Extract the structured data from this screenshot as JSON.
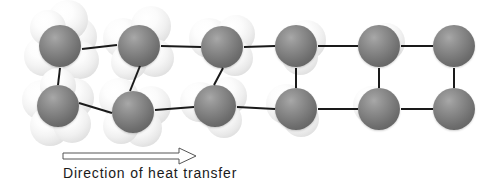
{
  "figure": {
    "width": 491,
    "height": 188,
    "background_color": "#ffffff",
    "molecule_color": "#6e6e6e",
    "ghost_color": "#e8e8e8",
    "bond_color": "#1a1a1a"
  },
  "caption": {
    "text": "Direction of heat transfer",
    "x": 63,
    "y": 165
  },
  "arrow": {
    "name": "heat-transfer-arrow",
    "direction": "right",
    "x1": 63,
    "y1": 156,
    "x2": 196,
    "y2": 156,
    "head_length": 17,
    "head_half_height": 8,
    "style": "hollow-outline",
    "stroke": "#555555"
  },
  "lattice": {
    "description": "Two rows of six molecules joined by bonds; vibration amplitude (number of pale ghost spheres) decreases from left (hot) to right (cold).",
    "rows": 2,
    "columns": 6,
    "radius": 21,
    "molecules": [
      {
        "id": "m-r1c1",
        "row": 1,
        "col": 1,
        "cx": 60,
        "cy": 46,
        "r": 21,
        "vibration": "high",
        "ghosts": [
          {
            "dx": -16,
            "dy": 10,
            "r": 20
          },
          {
            "dx": 17,
            "dy": -9,
            "r": 20
          },
          {
            "dx": 8,
            "dy": -26,
            "r": 20
          },
          {
            "dx": 20,
            "dy": 14,
            "r": 19
          },
          {
            "dx": -12,
            "dy": -18,
            "r": 18
          }
        ]
      },
      {
        "id": "m-r1c2",
        "row": 1,
        "col": 2,
        "cx": 139,
        "cy": 46,
        "r": 21,
        "vibration": "high",
        "ghosts": [
          {
            "dx": -16,
            "dy": -8,
            "r": 20
          },
          {
            "dx": 12,
            "dy": -20,
            "r": 20
          },
          {
            "dx": 16,
            "dy": 12,
            "r": 19
          },
          {
            "dx": -10,
            "dy": 16,
            "r": 18
          }
        ]
      },
      {
        "id": "m-r1c3",
        "row": 1,
        "col": 3,
        "cx": 222,
        "cy": 47,
        "r": 21,
        "vibration": "medium",
        "ghosts": [
          {
            "dx": -13,
            "dy": -9,
            "r": 20
          },
          {
            "dx": 14,
            "dy": -13,
            "r": 19
          },
          {
            "dx": 13,
            "dy": 11,
            "r": 18
          }
        ]
      },
      {
        "id": "m-r1c4",
        "row": 1,
        "col": 4,
        "cx": 296,
        "cy": 46,
        "r": 21,
        "vibration": "low",
        "ghosts": [
          {
            "dx": 10,
            "dy": -6,
            "r": 20
          },
          {
            "dx": 4,
            "dy": 11,
            "r": 18
          }
        ]
      },
      {
        "id": "m-r1c5",
        "row": 1,
        "col": 5,
        "cx": 379,
        "cy": 46,
        "r": 21,
        "vibration": "very-low",
        "ghosts": [
          {
            "dx": 7,
            "dy": -4,
            "r": 19
          }
        ]
      },
      {
        "id": "m-r1c6",
        "row": 1,
        "col": 6,
        "cx": 454,
        "cy": 46,
        "r": 21,
        "vibration": "none",
        "ghosts": []
      },
      {
        "id": "m-r2c1",
        "row": 2,
        "col": 1,
        "cx": 58,
        "cy": 106,
        "r": 21,
        "vibration": "high",
        "ghosts": [
          {
            "dx": -16,
            "dy": -6,
            "r": 20
          },
          {
            "dx": 16,
            "dy": -8,
            "r": 20
          },
          {
            "dx": -8,
            "dy": 20,
            "r": 20
          },
          {
            "dx": 14,
            "dy": 18,
            "r": 19
          },
          {
            "dx": 0,
            "dy": -20,
            "r": 18
          }
        ]
      },
      {
        "id": "m-r2c2",
        "row": 2,
        "col": 2,
        "cx": 133,
        "cy": 112,
        "r": 21,
        "vibration": "high",
        "ghosts": [
          {
            "dx": -14,
            "dy": -14,
            "r": 20
          },
          {
            "dx": 18,
            "dy": -6,
            "r": 20
          },
          {
            "dx": 10,
            "dy": 16,
            "r": 19
          },
          {
            "dx": -12,
            "dy": 14,
            "r": 18
          }
        ]
      },
      {
        "id": "m-r2c3",
        "row": 2,
        "col": 3,
        "cx": 215,
        "cy": 106,
        "r": 21,
        "vibration": "medium",
        "ghosts": [
          {
            "dx": -15,
            "dy": -4,
            "r": 20
          },
          {
            "dx": 13,
            "dy": -10,
            "r": 19
          },
          {
            "dx": 9,
            "dy": 14,
            "r": 18
          }
        ]
      },
      {
        "id": "m-r2c4",
        "row": 2,
        "col": 4,
        "cx": 296,
        "cy": 109,
        "r": 21,
        "vibration": "low",
        "ghosts": [
          {
            "dx": -10,
            "dy": -5,
            "r": 20
          },
          {
            "dx": 5,
            "dy": 10,
            "r": 18
          }
        ]
      },
      {
        "id": "m-r2c5",
        "row": 2,
        "col": 5,
        "cx": 379,
        "cy": 109,
        "r": 21,
        "vibration": "very-low",
        "ghosts": [
          {
            "dx": -7,
            "dy": -4,
            "r": 19
          }
        ]
      },
      {
        "id": "m-r2c6",
        "row": 2,
        "col": 6,
        "cx": 454,
        "cy": 109,
        "r": 21,
        "vibration": "none",
        "ghosts": []
      }
    ],
    "bonds": [
      {
        "id": "b-top-1-2",
        "from": "m-r1c1",
        "to": "m-r1c2",
        "x1": 82,
        "y1": 49,
        "x2": 117,
        "y2": 45,
        "width": 2
      },
      {
        "id": "b-top-2-3",
        "from": "m-r1c2",
        "to": "m-r1c3",
        "x1": 161,
        "y1": 46,
        "x2": 201,
        "y2": 47,
        "width": 2
      },
      {
        "id": "b-top-3-4",
        "from": "m-r1c3",
        "to": "m-r1c4",
        "x1": 244,
        "y1": 47,
        "x2": 275,
        "y2": 46,
        "width": 2
      },
      {
        "id": "b-top-4-5",
        "from": "m-r1c4",
        "to": "m-r1c5",
        "x1": 318,
        "y1": 46,
        "x2": 358,
        "y2": 46,
        "width": 2
      },
      {
        "id": "b-top-5-6",
        "from": "m-r1c5",
        "to": "m-r1c6",
        "x1": 401,
        "y1": 46,
        "x2": 433,
        "y2": 46,
        "width": 2
      },
      {
        "id": "b-bot-1-2",
        "from": "m-r2c1",
        "to": "m-r2c2",
        "x1": 79,
        "y1": 103,
        "x2": 112,
        "y2": 113,
        "width": 2
      },
      {
        "id": "b-bot-2-3",
        "from": "m-r2c2",
        "to": "m-r2c3",
        "x1": 155,
        "y1": 110,
        "x2": 194,
        "y2": 107,
        "width": 2
      },
      {
        "id": "b-bot-3-4",
        "from": "m-r2c3",
        "to": "m-r2c4",
        "x1": 237,
        "y1": 107,
        "x2": 275,
        "y2": 109,
        "width": 2
      },
      {
        "id": "b-bot-4-5",
        "from": "m-r2c4",
        "to": "m-r2c5",
        "x1": 318,
        "y1": 109,
        "x2": 358,
        "y2": 109,
        "width": 2
      },
      {
        "id": "b-bot-5-6",
        "from": "m-r2c5",
        "to": "m-r2c6",
        "x1": 401,
        "y1": 109,
        "x2": 433,
        "y2": 109,
        "width": 2
      },
      {
        "id": "b-col1",
        "from": "m-r1c1",
        "to": "m-r2c1",
        "x1": 60,
        "y1": 68,
        "x2": 58,
        "y2": 85,
        "width": 2
      },
      {
        "id": "b-col2",
        "from": "m-r1c2",
        "to": "m-r2c2",
        "x1": 140,
        "y1": 66,
        "x2": 130,
        "y2": 91,
        "width": 2
      },
      {
        "id": "b-col3",
        "from": "m-r1c3",
        "to": "m-r2c3",
        "x1": 223,
        "y1": 68,
        "x2": 214,
        "y2": 85,
        "width": 2
      },
      {
        "id": "b-col4",
        "from": "m-r1c4",
        "to": "m-r2c4",
        "x1": 296,
        "y1": 68,
        "x2": 296,
        "y2": 88,
        "width": 2
      },
      {
        "id": "b-col5",
        "from": "m-r1c5",
        "to": "m-r2c5",
        "x1": 379,
        "y1": 68,
        "x2": 379,
        "y2": 88,
        "width": 2
      },
      {
        "id": "b-col6",
        "from": "m-r1c6",
        "to": "m-r2c6",
        "x1": 454,
        "y1": 68,
        "x2": 454,
        "y2": 88,
        "width": 2
      }
    ]
  }
}
